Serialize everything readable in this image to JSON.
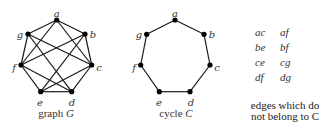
{
  "graph_g": {
    "caption_prefix": "graph ",
    "caption_var": "G",
    "vertices": [
      {
        "id": "a",
        "x": 56.7,
        "y": 20,
        "lx": 56.7,
        "ly": 14
      },
      {
        "id": "b",
        "x": 85,
        "y": 34,
        "lx": 93,
        "ly": 35
      },
      {
        "id": "c",
        "x": 91.7,
        "y": 65,
        "lx": 99,
        "ly": 68
      },
      {
        "id": "d",
        "x": 71.7,
        "y": 91.7,
        "lx": 72,
        "ly": 103
      },
      {
        "id": "e",
        "x": 40.7,
        "y": 91.7,
        "lx": 40,
        "ly": 103
      },
      {
        "id": "f",
        "x": 21,
        "y": 65,
        "lx": 14,
        "ly": 68
      },
      {
        "id": "g",
        "x": 28,
        "y": 34,
        "lx": 20,
        "ly": 35
      }
    ],
    "edges": [
      [
        "a",
        "b"
      ],
      [
        "b",
        "c"
      ],
      [
        "c",
        "d"
      ],
      [
        "d",
        "e"
      ],
      [
        "e",
        "f"
      ],
      [
        "f",
        "g"
      ],
      [
        "g",
        "a"
      ],
      [
        "a",
        "c"
      ],
      [
        "a",
        "f"
      ],
      [
        "b",
        "e"
      ],
      [
        "b",
        "f"
      ],
      [
        "c",
        "e"
      ],
      [
        "c",
        "g"
      ],
      [
        "d",
        "f"
      ],
      [
        "d",
        "g"
      ]
    ]
  },
  "cycle_c": {
    "caption_prefix": "cycle ",
    "caption_var": "C",
    "vertices": [
      {
        "id": "a",
        "x": 175,
        "y": 20,
        "lx": 175,
        "ly": 14
      },
      {
        "id": "b",
        "x": 204,
        "y": 34.3,
        "lx": 212,
        "ly": 35
      },
      {
        "id": "c",
        "x": 210,
        "y": 65,
        "lx": 217,
        "ly": 68
      },
      {
        "id": "d",
        "x": 190,
        "y": 91.7,
        "lx": 191,
        "ly": 103
      },
      {
        "id": "e",
        "x": 159.3,
        "y": 91.7,
        "lx": 159,
        "ly": 103
      },
      {
        "id": "f",
        "x": 140.7,
        "y": 65,
        "lx": 134,
        "ly": 68
      },
      {
        "id": "g",
        "x": 146.7,
        "y": 34.3,
        "lx": 139,
        "ly": 35
      }
    ],
    "edges": [
      [
        "a",
        "b"
      ],
      [
        "b",
        "c"
      ],
      [
        "c",
        "d"
      ],
      [
        "d",
        "e"
      ],
      [
        "e",
        "f"
      ],
      [
        "f",
        "g"
      ],
      [
        "g",
        "a"
      ]
    ]
  },
  "non_cycle_edges": {
    "rows": [
      [
        "ac",
        "af"
      ],
      [
        "be",
        "bf"
      ],
      [
        "ce",
        "cg"
      ],
      [
        "df",
        "dg"
      ]
    ],
    "caption_line1": "edges which do",
    "caption_line2": "not belong to C"
  },
  "colors": {
    "edge": "#1a1a1a",
    "vertex": "#000000",
    "text": "#333333"
  }
}
